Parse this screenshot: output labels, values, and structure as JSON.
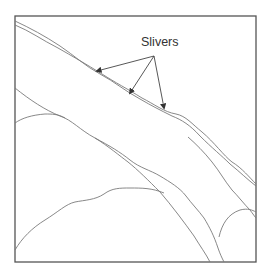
{
  "figure": {
    "annotation": {
      "label": "Slivers",
      "arrow_count": 3
    },
    "colors": {
      "frame": "#555555",
      "boundary_lines": "#7a7a7a",
      "arrows": "#444444",
      "background": "#ffffff"
    }
  }
}
